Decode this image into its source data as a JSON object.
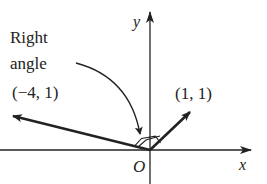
{
  "diagram": {
    "type": "vector-coordinate-plane",
    "axes": {
      "x_label": "x",
      "y_label": "y",
      "origin_label": "O"
    },
    "vectors": [
      {
        "name": "vector-1-1",
        "label": "(1, 1)",
        "x": 1,
        "y": 1
      },
      {
        "name": "vector-neg4-1",
        "label": "(−4, 1)",
        "x": -4,
        "y": 1
      }
    ],
    "annotation": {
      "line1": "Right",
      "line2": "angle"
    },
    "colors": {
      "ink": "#222222",
      "background": "#ffffff"
    }
  }
}
